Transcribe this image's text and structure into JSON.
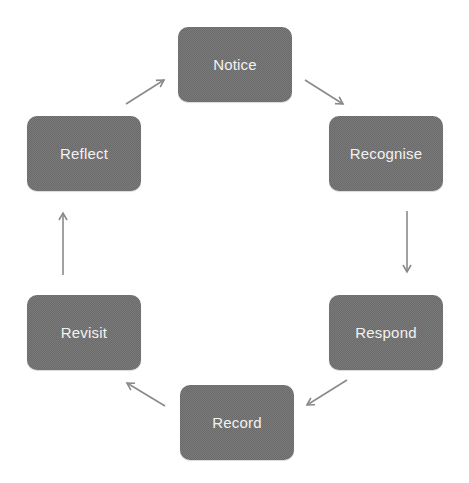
{
  "diagram": {
    "type": "cycle",
    "colors": {
      "node_fill": "#7b7b7b",
      "node_text": "#f2f2f2",
      "arrow": "#8a8a8a"
    },
    "nodes": [
      {
        "id": "notice",
        "label": "Notice"
      },
      {
        "id": "recognise",
        "label": "Recognise"
      },
      {
        "id": "respond",
        "label": "Respond"
      },
      {
        "id": "record",
        "label": "Record"
      },
      {
        "id": "revisit",
        "label": "Revisit"
      },
      {
        "id": "reflect",
        "label": "Reflect"
      }
    ],
    "edges": [
      {
        "from": "notice",
        "to": "recognise"
      },
      {
        "from": "recognise",
        "to": "respond"
      },
      {
        "from": "respond",
        "to": "record"
      },
      {
        "from": "record",
        "to": "revisit"
      },
      {
        "from": "revisit",
        "to": "reflect"
      },
      {
        "from": "reflect",
        "to": "notice"
      }
    ]
  }
}
